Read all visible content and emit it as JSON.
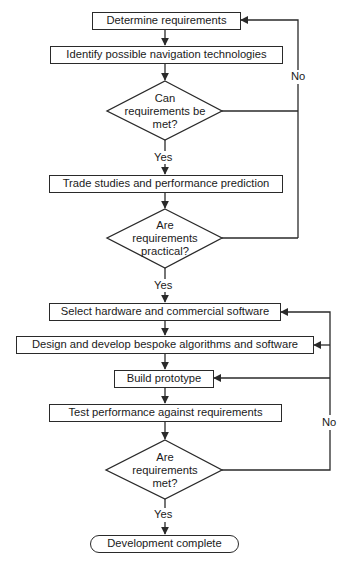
{
  "diagram": {
    "type": "flowchart",
    "steps": {
      "s1": "Determine requirements",
      "s2": "Identify possible navigation technologies",
      "s3": "Trade studies and performance prediction",
      "s4": "Select hardware and commercial software",
      "s5": "Design and develop bespoke algorithms and software",
      "s6": "Build prototype",
      "s7": "Test performance against requirements",
      "end": "Development complete"
    },
    "decisions": {
      "d1": {
        "line1": "Can",
        "line2": "requirements be",
        "line3": "met?"
      },
      "d2": {
        "line1": "Are",
        "line2": "requirements",
        "line3": "practical?"
      },
      "d3": {
        "line1": "Are",
        "line2": "requirements",
        "line3": "met?"
      }
    },
    "edge_labels": {
      "d1_yes": "Yes",
      "d2_yes": "Yes",
      "d3_yes": "Yes",
      "upper_no": "No",
      "lower_no": "No"
    },
    "colors": {
      "line": "#2a2a2a",
      "background": "#ffffff"
    }
  }
}
